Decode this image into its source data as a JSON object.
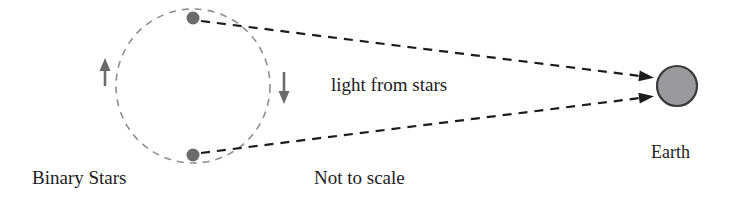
{
  "figure": {
    "caption_note": "Not to scale",
    "background_color": "#ffffff"
  },
  "labels": {
    "binary_stars": "Binary Stars",
    "light_from_stars": "light from stars",
    "not_to_scale": "Not to scale",
    "earth": "Earth"
  },
  "objects": {
    "orbit": {
      "name": "binary-star-orbit",
      "shape": "circle",
      "center_x": 193,
      "center_y": 86,
      "radius": 77,
      "stroke_color": "#8f8f92",
      "dash": "7 6",
      "stroke_width": 1.6
    },
    "star_top": {
      "name": "star-top",
      "center_x": 193,
      "center_y": 18,
      "radius": 6.5,
      "fill_color": "#6b6b6e"
    },
    "star_bottom": {
      "name": "star-bottom",
      "center_x": 193,
      "center_y": 155,
      "radius": 6.5,
      "fill_color": "#6b6b6e"
    },
    "earth": {
      "name": "earth-body",
      "center_x": 677,
      "center_y": 86,
      "radius": 20,
      "fill_color": "#9a9a9d",
      "stroke_color": "#3a3a3c",
      "stroke_width": 2.2
    }
  },
  "rays": {
    "stroke_color": "#1c1c1c",
    "dash": "9 7",
    "stroke_width": 2.2,
    "upper": {
      "name": "light-ray-upper",
      "x1": 201,
      "y1": 21,
      "x2": 648,
      "y2": 77
    },
    "lower": {
      "name": "light-ray-lower",
      "x1": 201,
      "y1": 153,
      "x2": 648,
      "y2": 97
    }
  },
  "orbit_direction_arrows": {
    "stroke_color": "#6b6b6e",
    "left": {
      "name": "orbit-arrow-up",
      "direction": "up",
      "x": 105,
      "y_tail": 86,
      "y_head": 58
    },
    "right": {
      "name": "orbit-arrow-down",
      "direction": "down",
      "x": 284,
      "y_tail": 72,
      "y_head": 104
    }
  },
  "label_positions": {
    "binary_stars": {
      "x": 32,
      "y": 184
    },
    "light_from_stars": {
      "x": 331,
      "y": 91
    },
    "not_to_scale": {
      "x": 314,
      "y": 184
    },
    "earth": {
      "x": 651,
      "y": 158
    }
  }
}
